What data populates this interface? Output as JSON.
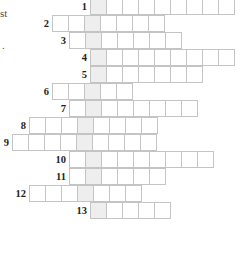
{
  "page": {
    "kind": "crossword-grid",
    "width": 241,
    "height": 255
  },
  "edge_fragments": [
    {
      "text": "st",
      "x": 0,
      "y": 8
    },
    {
      "text": ".",
      "x": 2,
      "y": 40
    }
  ],
  "grid": {
    "cell_size": 17,
    "shaded_column_left": 90,
    "colors": {
      "cell_fill": "#ffffff",
      "cell_border": "#c4c4c4",
      "shaded_fill": "#eeeeee",
      "number_text": "#231f20",
      "page_background": "#ffffff"
    },
    "rows": [
      {
        "number": "1",
        "top": -2,
        "left": 90,
        "cells": 9,
        "shaded_index": 0
      },
      {
        "number": "2",
        "top": 15,
        "left": 52,
        "cells": 7,
        "shaded_index": 2
      },
      {
        "number": "3",
        "top": 32,
        "left": 69,
        "cells": 7,
        "shaded_index": 1
      },
      {
        "number": "4",
        "top": 49,
        "left": 90,
        "cells": 9,
        "shaded_index": 0
      },
      {
        "number": "5",
        "top": 66,
        "left": 90,
        "cells": 7,
        "shaded_index": 0
      },
      {
        "number": "6",
        "top": 83,
        "left": 52,
        "cells": 5,
        "shaded_index": 2
      },
      {
        "number": "7",
        "top": 100,
        "left": 69,
        "cells": 8,
        "shaded_index": 1
      },
      {
        "number": "8",
        "top": 117,
        "left": 29,
        "cells": 8,
        "shaded_index": 3
      },
      {
        "number": "9",
        "top": 134,
        "left": 12,
        "cells": 9,
        "shaded_index": 4
      },
      {
        "number": "10",
        "top": 151,
        "left": 69,
        "cells": 9,
        "shaded_index": 1
      },
      {
        "number": "11",
        "top": 168,
        "left": 69,
        "cells": 6,
        "shaded_index": 1
      },
      {
        "number": "12",
        "top": 185,
        "left": 29,
        "cells": 7,
        "shaded_index": 3
      },
      {
        "number": "13",
        "top": 202,
        "left": 90,
        "cells": 5,
        "shaded_index": 0
      }
    ]
  }
}
